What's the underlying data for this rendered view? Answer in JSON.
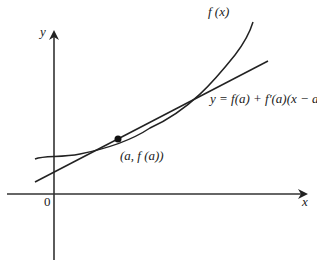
{
  "diagram": {
    "axes": {
      "x_label": "x",
      "y_label": "y",
      "origin_label": "0"
    },
    "curve": {
      "label": "f (x)"
    },
    "tangent_line": {
      "label": "y = f(a) + f′(a)(x − a)"
    },
    "point": {
      "label": "(a, f (a))"
    },
    "colors": {
      "stroke": "#222222",
      "background": "#ffffff"
    }
  }
}
